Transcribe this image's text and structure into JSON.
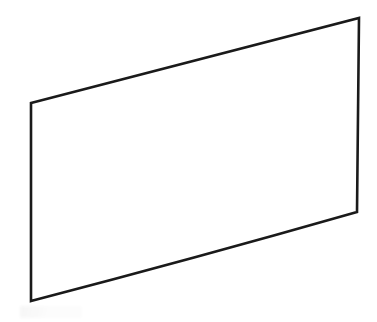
{
  "document": {
    "title": "Perspective quadrilateral line drawing",
    "description": "Hand/CAD style outline of a rectangular panel drawn in perspective, rendered as a closed four-sided polygon.",
    "background_color": "#ffffff",
    "canvas": {
      "width": 377,
      "height": 322
    }
  },
  "figure": {
    "name": "quadrilateral-outline",
    "shape_type": "closed-polygon",
    "sides": 4,
    "filled": false,
    "fill_color": "none",
    "stroke_color": "#1a1a1a",
    "stroke_width": 2.6,
    "stroke_linejoin": "miter",
    "stroke_linecap": "square",
    "vertices": [
      {
        "name": "top-left",
        "x": 31,
        "y": 103
      },
      {
        "name": "top-right",
        "x": 359,
        "y": 18
      },
      {
        "name": "bottom-right",
        "x": 357,
        "y": 212
      },
      {
        "name": "bottom-left",
        "x": 31,
        "y": 301
      }
    ],
    "edges": [
      {
        "name": "top-edge",
        "from": "top-left",
        "to": "top-right",
        "curvature": "straight"
      },
      {
        "name": "right-edge",
        "from": "top-right",
        "to": "bottom-right",
        "curvature": "straight"
      },
      {
        "name": "bottom-edge",
        "from": "bottom-right",
        "to": "bottom-left",
        "curvature": "slight-downward-bow"
      },
      {
        "name": "left-edge",
        "from": "bottom-left",
        "to": "top-left",
        "curvature": "straight"
      }
    ],
    "path_d": "M 31 103 L 359 18 L 357 212 Q 196 258 31 301 Z"
  },
  "artifacts": {
    "scan_smudge": {
      "name": "scan-smudge",
      "visible": true,
      "x": 20,
      "y": 306,
      "width": 62,
      "height": 12,
      "tone": "very-faint-gray"
    }
  }
}
